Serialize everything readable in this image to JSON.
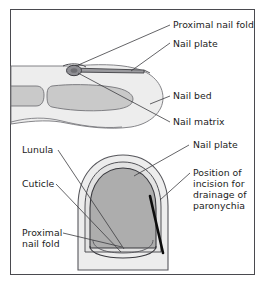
{
  "figure": {
    "title_present": false,
    "panels": [
      {
        "id": "sagittal-view",
        "name": "side view of fingertip",
        "labels": [
          {
            "id": "proximal-nail-fold",
            "text": "Proximal nail fold"
          },
          {
            "id": "nail-plate",
            "text": "Nail plate"
          },
          {
            "id": "nail-bed",
            "text": "Nail bed"
          },
          {
            "id": "nail-matrix",
            "text": "Nail matrix"
          }
        ]
      },
      {
        "id": "dorsal-view",
        "name": "top view of fingertip",
        "labels": [
          {
            "id": "lunula",
            "text": "Lunula"
          },
          {
            "id": "nail-plate",
            "text": "Nail plate"
          },
          {
            "id": "cuticle",
            "text": "Cuticle"
          },
          {
            "id": "incision",
            "text_line_1": "Position of",
            "text_line_2": "incision for",
            "text_line_3": "drainage of",
            "text_line_4": "paronychia"
          },
          {
            "id": "proximal-nail-fold",
            "text_line_1": "Proximal",
            "text_line_2": "nail fold"
          }
        ]
      }
    ]
  },
  "colors": {
    "frame_border": "#4a4a4f",
    "background": "#ffffff",
    "soft_tissue_fill": "#ededed",
    "soft_tissue_stroke": "#77777c",
    "bone_fill": "#c9c9c9",
    "bone_stroke": "#6e6e73",
    "nail_plate_fill": "#adadad",
    "nail_plate_stroke": "#4a4a4f",
    "nail_fold_fill": "#e3e3e3",
    "incision_line": "#0d0d0d",
    "leader_line": "#3c3c40",
    "text": "#1b1b1b"
  }
}
